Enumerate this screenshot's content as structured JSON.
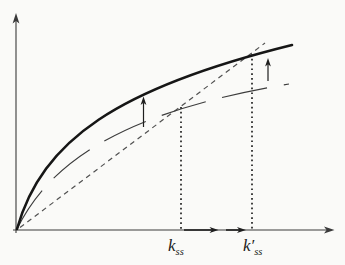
{
  "figure": {
    "axis_labels": {
      "k_ss": {
        "base": "k",
        "sub": "ss"
      },
      "k_ss_prime": {
        "base": "k′",
        "sub": "ss"
      }
    },
    "colors": {
      "background": "#fafaf8",
      "axis": "#3a3a3a",
      "thick_curve": "#161616",
      "thin_curve": "#3c3c3c",
      "dashed_line": "#505050",
      "dotted_line": "#222222",
      "arrow": "#1e1e1e",
      "label": "#1a1a1a"
    }
  }
}
